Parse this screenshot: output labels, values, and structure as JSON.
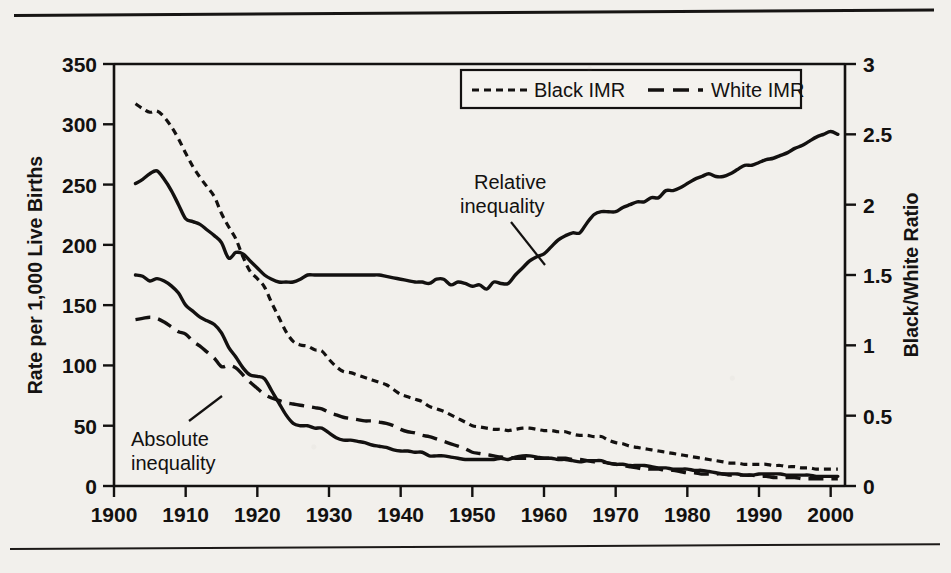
{
  "figure": {
    "name": "infant-mortality-rate-by-race-figure",
    "background_color": "#f2f0ec",
    "ink_color": "#131110"
  },
  "legend": {
    "position": "top-center-right",
    "items": [
      {
        "label": "Black IMR",
        "dash": "short-dash",
        "key": "black_imr"
      },
      {
        "label": "White IMR",
        "dash": "long-dash",
        "key": "white_imr"
      }
    ]
  },
  "annotations": [
    {
      "name": "relative-inequality-annotation",
      "line1": "Relative",
      "line2": "inequality"
    },
    {
      "name": "absolute-inequality-annotation",
      "line1": "Absolute",
      "line2": "inequality"
    }
  ],
  "chart_data": {
    "type": "line",
    "title": "",
    "xlabel": "",
    "ylabel": "Rate per 1,000 Live Births",
    "y2label": "Black/White Ratio",
    "xlim": [
      1900,
      2002
    ],
    "ylim": [
      0,
      350
    ],
    "y2lim": [
      0,
      3
    ],
    "grid": false,
    "legend_position": "top-right",
    "xticks": [
      1900,
      1910,
      1920,
      1930,
      1940,
      1950,
      1960,
      1970,
      1980,
      1990,
      2000
    ],
    "xticklabels": [
      "1900",
      "1910",
      "1920",
      "1930",
      "1940",
      "1950",
      "1960",
      "1970",
      "1980",
      "1990",
      "2000"
    ],
    "yticks": [
      0,
      50,
      100,
      150,
      200,
      250,
      300,
      350
    ],
    "yticklabels": [
      "0",
      "50",
      "100",
      "150",
      "200",
      "250",
      "300",
      "350"
    ],
    "y2ticks": [
      0,
      0.5,
      1,
      1.5,
      2,
      2.5,
      3
    ],
    "y2ticklabels": [
      "0",
      "0.5",
      "1",
      "1.5",
      "2",
      "2.5",
      "3"
    ],
    "series": [
      {
        "name": "Black IMR",
        "axis": "left",
        "style": "short-dash",
        "x": [
          1903,
          1904,
          1905,
          1906,
          1907,
          1908,
          1909,
          1910,
          1911,
          1912,
          1913,
          1914,
          1915,
          1916,
          1917,
          1918,
          1919,
          1920,
          1921,
          1922,
          1923,
          1924,
          1925,
          1926,
          1927,
          1928,
          1929,
          1930,
          1931,
          1932,
          1933,
          1934,
          1935,
          1936,
          1937,
          1938,
          1939,
          1940,
          1941,
          1942,
          1943,
          1944,
          1945,
          1946,
          1947,
          1948,
          1949,
          1950,
          1951,
          1952,
          1953,
          1954,
          1955,
          1956,
          1957,
          1958,
          1959,
          1960,
          1961,
          1962,
          1963,
          1964,
          1965,
          1966,
          1967,
          1968,
          1969,
          1970,
          1971,
          1972,
          1973,
          1974,
          1975,
          1976,
          1977,
          1978,
          1979,
          1980,
          1981,
          1982,
          1983,
          1984,
          1985,
          1986,
          1987,
          1988,
          1989,
          1990,
          1991,
          1992,
          1993,
          1994,
          1995,
          1996,
          1997,
          1998,
          1999,
          2000,
          2001
        ],
        "y": [
          317,
          313,
          310,
          311,
          306,
          298,
          288,
          276,
          265,
          256,
          248,
          240,
          226,
          215,
          205,
          190,
          178,
          172,
          165,
          152,
          140,
          128,
          120,
          117,
          116,
          113,
          112,
          105,
          99,
          95,
          94,
          92,
          90,
          88,
          86,
          84,
          80,
          76,
          74,
          72,
          70,
          66,
          64,
          62,
          59,
          56,
          53,
          50,
          49,
          48,
          47,
          47,
          46,
          47,
          48,
          48,
          47,
          46,
          46,
          45,
          45,
          43,
          42,
          42,
          41,
          41,
          38,
          36,
          35,
          33,
          32,
          31,
          30,
          29,
          28,
          27,
          26,
          25,
          24,
          23,
          22,
          21,
          20,
          19,
          19,
          18,
          18,
          18,
          18,
          17,
          17,
          16,
          16,
          15,
          15,
          14,
          14,
          14,
          14
        ]
      },
      {
        "name": "White IMR",
        "axis": "left",
        "style": "long-dash",
        "x": [
          1903,
          1904,
          1905,
          1906,
          1907,
          1908,
          1909,
          1910,
          1911,
          1912,
          1913,
          1914,
          1915,
          1916,
          1917,
          1918,
          1919,
          1920,
          1921,
          1922,
          1923,
          1924,
          1925,
          1926,
          1927,
          1928,
          1929,
          1930,
          1931,
          1932,
          1933,
          1934,
          1935,
          1936,
          1937,
          1938,
          1939,
          1940,
          1941,
          1942,
          1943,
          1944,
          1945,
          1946,
          1947,
          1948,
          1949,
          1950,
          1951,
          1952,
          1953,
          1954,
          1955,
          1956,
          1957,
          1958,
          1959,
          1960,
          1961,
          1962,
          1963,
          1964,
          1965,
          1966,
          1967,
          1968,
          1969,
          1970,
          1971,
          1972,
          1973,
          1974,
          1975,
          1976,
          1977,
          1978,
          1979,
          1980,
          1981,
          1982,
          1983,
          1984,
          1985,
          1986,
          1987,
          1988,
          1989,
          1990,
          1991,
          1992,
          1993,
          1994,
          1995,
          1996,
          1997,
          1998,
          1999,
          2000,
          2001
        ],
        "y": [
          138,
          139,
          140,
          139,
          136,
          132,
          128,
          126,
          120,
          116,
          111,
          106,
          99,
          100,
          98,
          92,
          86,
          81,
          76,
          73,
          71,
          69,
          68,
          67,
          66,
          65,
          64,
          61,
          59,
          57,
          56,
          55,
          54,
          54,
          53,
          52,
          50,
          47,
          45,
          44,
          42,
          41,
          39,
          37,
          35,
          33,
          31,
          28,
          27,
          26,
          25,
          24,
          24,
          23,
          23,
          23,
          23,
          23,
          23,
          23,
          23,
          22,
          22,
          21,
          20,
          20,
          19,
          18,
          17,
          16,
          15,
          14,
          14,
          14,
          13,
          13,
          12,
          11,
          11,
          10,
          10,
          10,
          10,
          9,
          9,
          9,
          9,
          8,
          8,
          7,
          7,
          7,
          7,
          6,
          6,
          6,
          6,
          6,
          6
        ]
      },
      {
        "name": "Absolute inequality",
        "axis": "left",
        "style": "solid",
        "x": [
          1903,
          1904,
          1905,
          1906,
          1907,
          1908,
          1909,
          1910,
          1911,
          1912,
          1913,
          1914,
          1915,
          1916,
          1917,
          1918,
          1919,
          1920,
          1921,
          1922,
          1923,
          1924,
          1925,
          1926,
          1927,
          1928,
          1929,
          1930,
          1931,
          1932,
          1933,
          1934,
          1935,
          1936,
          1937,
          1938,
          1939,
          1940,
          1941,
          1942,
          1943,
          1944,
          1945,
          1946,
          1947,
          1948,
          1949,
          1950,
          1951,
          1952,
          1953,
          1954,
          1955,
          1956,
          1957,
          1958,
          1959,
          1960,
          1961,
          1962,
          1963,
          1964,
          1965,
          1966,
          1967,
          1968,
          1969,
          1970,
          1971,
          1972,
          1973,
          1974,
          1975,
          1976,
          1977,
          1978,
          1979,
          1980,
          1981,
          1982,
          1983,
          1984,
          1985,
          1986,
          1987,
          1988,
          1989,
          1990,
          1991,
          1992,
          1993,
          1994,
          1995,
          1996,
          1997,
          1998,
          1999,
          2000,
          2001
        ],
        "y": [
          175,
          174,
          170,
          172,
          170,
          166,
          160,
          150,
          145,
          140,
          137,
          134,
          127,
          115,
          107,
          98,
          92,
          91,
          89,
          79,
          69,
          59,
          52,
          50,
          50,
          48,
          48,
          44,
          40,
          38,
          38,
          37,
          36,
          34,
          33,
          32,
          30,
          29,
          29,
          28,
          28,
          25,
          25,
          25,
          24,
          23,
          22,
          22,
          22,
          22,
          22,
          23,
          22,
          24,
          25,
          25,
          24,
          23,
          23,
          22,
          22,
          21,
          20,
          21,
          21,
          21,
          19,
          18,
          18,
          17,
          17,
          17,
          16,
          15,
          15,
          14,
          14,
          14,
          13,
          13,
          12,
          11,
          10,
          10,
          10,
          9,
          9,
          10,
          10,
          10,
          10,
          9,
          9,
          9,
          9,
          8,
          8,
          8,
          8
        ]
      },
      {
        "name": "Relative inequality",
        "axis": "right",
        "style": "solid",
        "x": [
          1903,
          1904,
          1905,
          1906,
          1907,
          1908,
          1909,
          1910,
          1911,
          1912,
          1913,
          1914,
          1915,
          1916,
          1917,
          1918,
          1919,
          1920,
          1921,
          1922,
          1923,
          1924,
          1925,
          1926,
          1927,
          1928,
          1929,
          1930,
          1931,
          1932,
          1933,
          1934,
          1935,
          1936,
          1937,
          1938,
          1939,
          1940,
          1941,
          1942,
          1943,
          1944,
          1945,
          1946,
          1947,
          1948,
          1949,
          1950,
          1951,
          1952,
          1953,
          1954,
          1955,
          1956,
          1957,
          1958,
          1959,
          1960,
          1961,
          1962,
          1963,
          1964,
          1965,
          1966,
          1967,
          1968,
          1969,
          1970,
          1971,
          1972,
          1973,
          1974,
          1975,
          1976,
          1977,
          1978,
          1979,
          1980,
          1981,
          1982,
          1983,
          1984,
          1985,
          1986,
          1987,
          1988,
          1989,
          1990,
          1991,
          1992,
          1993,
          1994,
          1995,
          1996,
          1997,
          1998,
          1999,
          2000,
          2001
        ],
        "y": [
          2.15,
          2.18,
          2.22,
          2.24,
          2.18,
          2.1,
          2.0,
          1.9,
          1.88,
          1.86,
          1.82,
          1.78,
          1.73,
          1.62,
          1.66,
          1.65,
          1.6,
          1.55,
          1.5,
          1.47,
          1.45,
          1.45,
          1.45,
          1.47,
          1.5,
          1.5,
          1.5,
          1.5,
          1.5,
          1.5,
          1.5,
          1.5,
          1.5,
          1.5,
          1.5,
          1.49,
          1.48,
          1.47,
          1.46,
          1.45,
          1.45,
          1.44,
          1.47,
          1.47,
          1.43,
          1.45,
          1.44,
          1.42,
          1.43,
          1.4,
          1.45,
          1.44,
          1.44,
          1.5,
          1.55,
          1.6,
          1.63,
          1.65,
          1.7,
          1.75,
          1.78,
          1.8,
          1.8,
          1.87,
          1.93,
          1.95,
          1.95,
          1.95,
          1.98,
          2.0,
          2.02,
          2.02,
          2.05,
          2.05,
          2.1,
          2.1,
          2.12,
          2.15,
          2.18,
          2.2,
          2.22,
          2.2,
          2.2,
          2.22,
          2.25,
          2.28,
          2.28,
          2.3,
          2.32,
          2.33,
          2.35,
          2.37,
          2.4,
          2.42,
          2.45,
          2.48,
          2.5,
          2.52,
          2.5
        ]
      }
    ]
  }
}
